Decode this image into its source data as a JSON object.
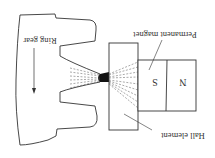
{
  "diagram": {
    "orientation": "rotated 180 degrees",
    "labels": {
      "ring_gear": "Ring gear",
      "permanent_magnet": "Permanent magnet",
      "hall_element": "Hall element",
      "south_pole": "S",
      "north_pole": "N"
    },
    "colors": {
      "line": "#333333",
      "field_lines": "#555555",
      "flux_concentration": "#111111",
      "background": "#ffffff"
    },
    "components": [
      {
        "id": "ring-gear",
        "label_key": "ring_gear"
      },
      {
        "id": "hall-element",
        "label_key": "hall_element"
      },
      {
        "id": "permanent-magnet",
        "label_key": "permanent_magnet",
        "poles": [
          "S",
          "N"
        ]
      }
    ]
  }
}
